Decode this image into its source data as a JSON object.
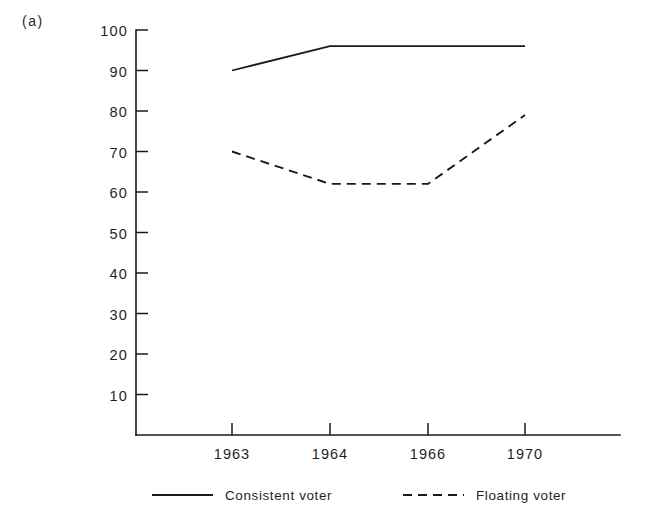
{
  "panel": {
    "label": "(a)"
  },
  "chart_data": {
    "type": "line",
    "title": "",
    "subtitle": "",
    "xlabel": "",
    "ylabel": "",
    "categories": [
      "1963",
      "1964",
      "1966",
      "1970"
    ],
    "x_tick_labels": [
      "1963",
      "1964",
      "1966",
      "1970"
    ],
    "y_tick_labels": [
      "10",
      "20",
      "30",
      "40",
      "50",
      "60",
      "70",
      "80",
      "90",
      "100"
    ],
    "y_tick_values": [
      10,
      20,
      30,
      40,
      50,
      60,
      70,
      80,
      90,
      100
    ],
    "ylim": [
      0,
      100
    ],
    "grid": false,
    "legend_position": "below-axes",
    "series": [
      {
        "name": "Consistent voter",
        "style": "solid",
        "color": "#1a1a1a",
        "values": [
          90,
          96,
          96,
          96
        ]
      },
      {
        "name": "Floating voter",
        "style": "dashed",
        "color": "#1a1a1a",
        "values": [
          70,
          62,
          62,
          79
        ]
      }
    ]
  },
  "legend": {
    "entries": [
      {
        "label": "Consistent voter",
        "style": "solid"
      },
      {
        "label": "Floating voter",
        "style": "dashed"
      }
    ]
  },
  "colors": {
    "ink": "#1a1a1a",
    "background": "#ffffff"
  }
}
